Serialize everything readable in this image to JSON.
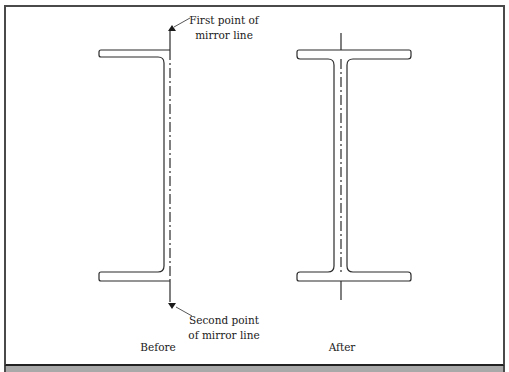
{
  "figure": {
    "annotations": {
      "first_point_line1": "First point of",
      "first_point_line2": "mirror line",
      "second_point_line1": "Second point",
      "second_point_line2": "of mirror line"
    },
    "captions": {
      "before": "Before",
      "after": "After"
    },
    "shapes": [
      {
        "name": "left-half-i-beam",
        "state": "before"
      },
      {
        "name": "mirrored-full-i-beam",
        "state": "after"
      }
    ],
    "colors": {
      "line": "#2b2b2b",
      "frame": "#4a4a4a",
      "band": "#a9a9a9"
    }
  }
}
